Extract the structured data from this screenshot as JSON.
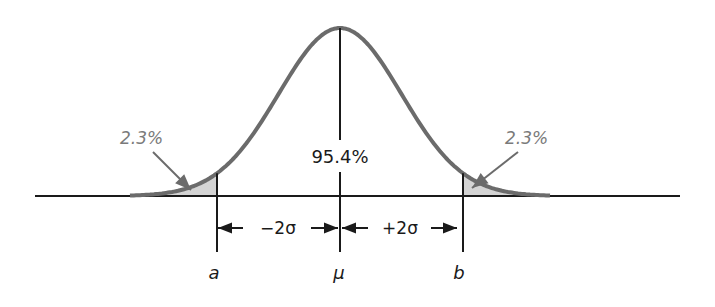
{
  "chart_data": {
    "type": "area",
    "title": "",
    "center_label": "95.4%",
    "tail_labels": {
      "left": "2.3%",
      "right": "2.3%"
    },
    "interval_labels": {
      "left": "−2σ",
      "right": "+2σ"
    },
    "axis_labels": {
      "a": "a",
      "mu": "μ",
      "b": "b"
    },
    "regions": [
      {
        "name": "left tail",
        "from": "-inf",
        "to": "a",
        "percent": 2.3,
        "shaded": true
      },
      {
        "name": "center",
        "from": "a",
        "to": "b",
        "percent": 95.4,
        "shaded": false
      },
      {
        "name": "right tail",
        "from": "b",
        "to": "+inf",
        "percent": 2.3,
        "shaded": true
      }
    ],
    "sigma_multiple": 2,
    "colors": {
      "curve": "#6b6b6b",
      "tail_fill": "#d4d4d4",
      "tail_label": "#7a7a7a",
      "lines": "#1a1a1a"
    }
  }
}
